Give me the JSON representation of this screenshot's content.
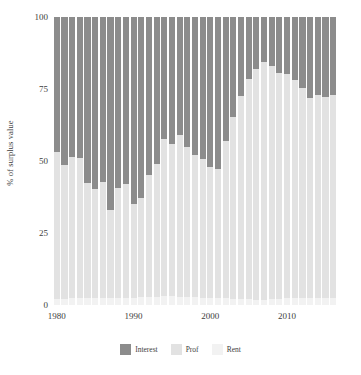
{
  "chart_data": {
    "type": "bar",
    "stacked": true,
    "title": "",
    "xlabel": "",
    "ylabel": "% of surplus value",
    "ylim": [
      0,
      100
    ],
    "yticks": [
      0,
      25,
      50,
      75,
      100
    ],
    "xticks": [
      1980,
      1990,
      2000,
      2010
    ],
    "grid": false,
    "legend_position": "bottom",
    "colors": {
      "interest": "#8c8c8c",
      "profit": "#e2e2e2",
      "rent": "#f2f2f2"
    },
    "series": [
      {
        "name": "Interest",
        "key": "interest",
        "color": "#8c8c8c"
      },
      {
        "name": "Prof",
        "key": "profit",
        "color": "#e2e2e2"
      },
      {
        "name": "Rent",
        "key": "rent",
        "color": "#f2f2f2"
      }
    ],
    "categories": [
      1980,
      1981,
      1982,
      1983,
      1984,
      1985,
      1986,
      1987,
      1988,
      1989,
      1990,
      1991,
      1992,
      1993,
      1994,
      1995,
      1996,
      1997,
      1998,
      1999,
      2000,
      2001,
      2002,
      2003,
      2004,
      2005,
      2006,
      2007,
      2008,
      2009,
      2010,
      2011,
      2012,
      2013,
      2014,
      2015,
      2016
    ],
    "values": {
      "rent": [
        2.0,
        2.2,
        2.4,
        2.5,
        2.4,
        2.3,
        2.3,
        2.4,
        2.5,
        2.6,
        2.6,
        2.7,
        2.8,
        2.9,
        3.0,
        3.0,
        2.9,
        2.8,
        2.7,
        2.6,
        2.5,
        2.4,
        2.3,
        2.2,
        2.1,
        2.0,
        1.9,
        1.9,
        2.0,
        2.2,
        2.3,
        2.3,
        2.3,
        2.3,
        2.4,
        2.4,
        2.4
      ],
      "profit": [
        51.0,
        46.5,
        49.0,
        48.5,
        40.0,
        38.0,
        40.5,
        30.5,
        38.0,
        39.5,
        32.5,
        34.5,
        42.5,
        46.0,
        54.5,
        53.0,
        56.0,
        52.0,
        49.5,
        48.0,
        45.5,
        45.0,
        54.5,
        63.0,
        70.5,
        76.5,
        80.0,
        82.5,
        81.0,
        78.5,
        78.0,
        76.0,
        73.0,
        69.5,
        70.5,
        70.0,
        70.5
      ],
      "interest": [
        47.0,
        51.3,
        48.6,
        49.0,
        57.6,
        59.7,
        57.2,
        67.1,
        59.5,
        57.9,
        64.9,
        62.8,
        54.7,
        51.1,
        42.5,
        44.0,
        41.1,
        45.2,
        47.8,
        49.4,
        52.0,
        52.6,
        43.2,
        34.8,
        27.4,
        21.5,
        18.1,
        15.6,
        17.0,
        19.3,
        19.7,
        21.7,
        24.7,
        28.2,
        27.1,
        27.6,
        27.1
      ]
    }
  }
}
